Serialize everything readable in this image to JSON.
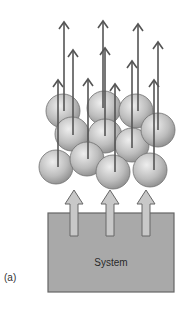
{
  "figure": {
    "panel_label": "(a)",
    "system_label": "System",
    "colors": {
      "box_fill": "#a9a9a9",
      "box_stroke": "#666666",
      "sphere_light": "#e6e6e6",
      "sphere_dark": "#8c8c8c",
      "sphere_stroke": "#707070",
      "arrow": "#555555",
      "block_arrow_fill": "#c8c8c8",
      "block_arrow_stroke": "#666666"
    },
    "system_box": {
      "x": 48,
      "y": 213,
      "width": 126,
      "height": 79
    },
    "block_arrows": [
      {
        "x": 74,
        "tip_y": 190,
        "base_y": 236
      },
      {
        "x": 110,
        "tip_y": 190,
        "base_y": 236
      },
      {
        "x": 146,
        "tip_y": 190,
        "base_y": 236
      }
    ],
    "spheres": [
      {
        "cx": 63,
        "cy": 111,
        "r": 17
      },
      {
        "cx": 104,
        "cy": 108,
        "r": 17
      },
      {
        "cx": 136,
        "cy": 111,
        "r": 17
      },
      {
        "cx": 72,
        "cy": 134,
        "r": 17
      },
      {
        "cx": 105,
        "cy": 136,
        "r": 17
      },
      {
        "cx": 132,
        "cy": 145,
        "r": 17
      },
      {
        "cx": 158,
        "cy": 130,
        "r": 17
      },
      {
        "cx": 56,
        "cy": 167,
        "r": 17
      },
      {
        "cx": 87,
        "cy": 159,
        "r": 17
      },
      {
        "cx": 113,
        "cy": 172,
        "r": 17
      },
      {
        "cx": 150,
        "cy": 170,
        "r": 17
      }
    ],
    "velocity_arrows": [
      {
        "x": 64,
        "tip_y": 22,
        "base_y": 111
      },
      {
        "x": 73,
        "tip_y": 50,
        "base_y": 135
      },
      {
        "x": 58,
        "tip_y": 80,
        "base_y": 167
      },
      {
        "x": 88,
        "tip_y": 79,
        "base_y": 159
      },
      {
        "x": 103,
        "tip_y": 21,
        "base_y": 108
      },
      {
        "x": 105,
        "tip_y": 48,
        "base_y": 136
      },
      {
        "x": 115,
        "tip_y": 84,
        "base_y": 172
      },
      {
        "x": 138,
        "tip_y": 24,
        "base_y": 111
      },
      {
        "x": 132,
        "tip_y": 61,
        "base_y": 148
      },
      {
        "x": 158,
        "tip_y": 42,
        "base_y": 130
      },
      {
        "x": 154,
        "tip_y": 80,
        "base_y": 170
      }
    ]
  }
}
